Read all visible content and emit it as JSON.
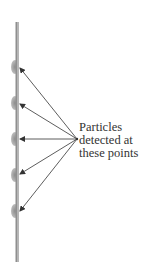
{
  "diagram": {
    "label_lines": [
      "Particles",
      "detected at",
      "these points"
    ],
    "screen": {
      "x": 17,
      "y_top": 22,
      "y_bottom": 262,
      "color": "#8a8a8a"
    },
    "bumps_y": [
      67,
      103,
      139,
      175,
      211
    ],
    "arrow_origin": {
      "x": 77,
      "y": 139
    },
    "arrow_color": "#333333",
    "bump_color": "#9a9a9a"
  }
}
